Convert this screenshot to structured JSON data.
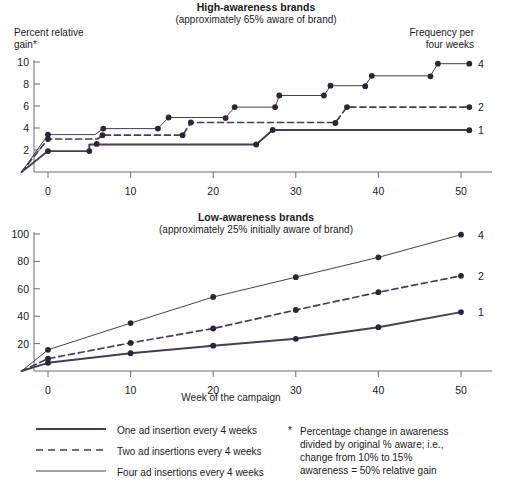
{
  "figure": {
    "colors": {
      "line": "#4a3a57",
      "axis": "#6d6d6d",
      "text": "#1a1a1a"
    },
    "xlabel": "Week of the campaign",
    "frequency_header_line1": "Frequency per",
    "frequency_header_line2": "four weeks"
  },
  "legend": {
    "items": [
      {
        "style": "solid-thick",
        "label": "One ad insertion every 4 weeks"
      },
      {
        "style": "dashed",
        "label": "Two ad insertions every 4 weeks"
      },
      {
        "style": "solid-thin",
        "label": "Four ad insertions every 4 weeks"
      }
    ]
  },
  "footnote": {
    "marker": "*",
    "line1": "Percentage change in awareness",
    "line2": "divided by original % aware; i.e.,",
    "line3": "change from 10% to 15%",
    "line4": "awareness = 50% relative gain"
  },
  "chart_data": [
    {
      "type": "line",
      "id": "high-awareness",
      "title": "High-awareness brands",
      "subtitle": "(approximately 65% aware of brand)",
      "ylabel_line1": "Percent relative",
      "ylabel_line2": "gain*",
      "xlabel": "",
      "xlim": [
        -3.5,
        53
      ],
      "ylim": [
        0,
        10.6
      ],
      "xticks": [
        0,
        10,
        20,
        30,
        40,
        50
      ],
      "yticks": [
        2,
        4,
        6,
        8,
        10
      ],
      "xtick_labels": [
        "0",
        "10",
        "20",
        "30",
        "40",
        "50"
      ],
      "ytick_labels": [
        "2",
        "4",
        "6",
        "8",
        "10"
      ],
      "grid": false,
      "legend_position": "right-outside",
      "step_chart": true,
      "series": [
        {
          "name": "1",
          "end_label": "1",
          "style": "solid-thick",
          "x": [
            -3.2,
            0,
            5,
            5,
            25.2,
            27.2,
            51
          ],
          "y": [
            0,
            1.9,
            1.9,
            2.5,
            2.5,
            3.82,
            3.82
          ],
          "markers_x": [
            0,
            5,
            5.9,
            25.2,
            27.2,
            51
          ],
          "markers_y": [
            1.9,
            1.9,
            2.55,
            2.5,
            3.82,
            3.8
          ]
        },
        {
          "name": "2",
          "end_label": "2",
          "style": "dashed",
          "x": [
            -3.2,
            0,
            6,
            6.6,
            16.3,
            17.3,
            34.8,
            36.2,
            51
          ],
          "y": [
            0,
            3.0,
            3.0,
            3.35,
            3.35,
            4.5,
            4.5,
            5.9,
            5.9
          ],
          "markers_x": [
            0,
            6.6,
            16.3,
            17.3,
            34.8,
            36.2,
            51
          ],
          "markers_y": [
            3.0,
            3.35,
            3.35,
            4.5,
            4.45,
            5.9,
            5.9
          ]
        },
        {
          "name": "4",
          "end_label": "4",
          "style": "solid-thin",
          "x": [
            -3.2,
            0,
            5.7,
            6.7,
            13.3,
            14.6,
            21.5,
            22.6,
            27.5,
            28.0,
            33.4,
            34.2,
            38.4,
            39.2,
            46.3,
            47.2,
            51
          ],
          "y": [
            0,
            3.4,
            3.4,
            3.95,
            3.95,
            4.95,
            4.95,
            5.9,
            5.9,
            6.95,
            6.95,
            7.85,
            7.85,
            8.75,
            8.75,
            9.85,
            9.85
          ],
          "markers_x": [
            0,
            6.7,
            13.3,
            14.6,
            21.5,
            22.6,
            27.5,
            28.0,
            33.4,
            34.2,
            38.4,
            39.2,
            46.3,
            47.2,
            51
          ],
          "markers_y": [
            3.4,
            3.95,
            3.95,
            4.95,
            4.9,
            5.9,
            5.9,
            6.95,
            6.95,
            7.85,
            7.8,
            8.75,
            8.7,
            9.85,
            9.85
          ]
        }
      ]
    },
    {
      "type": "line",
      "id": "low-awareness",
      "title": "Low-awareness brands",
      "subtitle": "(approximately 25% initially aware of brand)",
      "ylabel": "",
      "xlabel": "Week of the campaign",
      "xlim": [
        -3.5,
        53
      ],
      "ylim": [
        0,
        106
      ],
      "xticks": [
        0,
        10,
        20,
        30,
        40,
        50
      ],
      "yticks": [
        20,
        40,
        60,
        80,
        100
      ],
      "xtick_labels": [
        "0",
        "10",
        "20",
        "30",
        "40",
        "50"
      ],
      "ytick_labels": [
        "20",
        "40",
        "60",
        "80",
        "100"
      ],
      "grid": false,
      "legend_position": "right-outside",
      "step_chart": false,
      "series": [
        {
          "name": "1",
          "end_label": "1",
          "style": "solid-thick",
          "x": [
            -3.2,
            0,
            10,
            20,
            30,
            40,
            50
          ],
          "y": [
            0,
            6.0,
            13.0,
            18.5,
            23.5,
            32.0,
            43.0
          ],
          "markers_x": [
            0,
            10,
            20,
            30,
            40,
            50
          ],
          "markers_y": [
            6.0,
            13.0,
            18.5,
            23.5,
            32.0,
            43.0
          ]
        },
        {
          "name": "2",
          "end_label": "2",
          "style": "dashed",
          "x": [
            -3.2,
            0,
            10,
            20,
            30,
            40,
            50
          ],
          "y": [
            0,
            9.0,
            20.5,
            31.0,
            44.5,
            57.5,
            69.5
          ],
          "markers_x": [
            0,
            10,
            20,
            30,
            40,
            50
          ],
          "markers_y": [
            9.0,
            20.5,
            31.0,
            44.5,
            57.5,
            69.5
          ]
        },
        {
          "name": "4",
          "end_label": "4",
          "style": "solid-thin",
          "x": [
            -3.2,
            0,
            10,
            20,
            30,
            40,
            50
          ],
          "y": [
            0,
            15.5,
            35.0,
            54.0,
            68.5,
            83.0,
            99.5
          ],
          "markers_x": [
            0,
            10,
            20,
            30,
            40,
            50
          ],
          "markers_y": [
            15.5,
            35.0,
            54.0,
            68.5,
            83.0,
            99.5
          ]
        }
      ]
    }
  ]
}
